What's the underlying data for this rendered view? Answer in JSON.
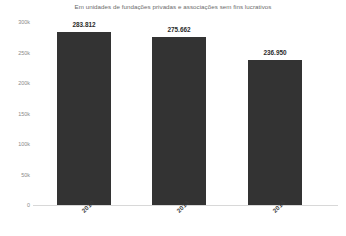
{
  "chart_data": {
    "type": "bar",
    "title": "Em unidades de fundações privadas e associações sem fins lucrativos",
    "xlabel": "",
    "ylabel": "",
    "categories": [
      "2010",
      "2013",
      "2016"
    ],
    "values": [
      283812,
      275662,
      236950
    ],
    "value_labels": [
      "283.812",
      "275.662",
      "236.950"
    ],
    "ylim": [
      0,
      300000
    ],
    "ytick_values": [
      300000,
      250000,
      200000,
      150000,
      100000,
      50000,
      0
    ],
    "ytick_labels": [
      "300k",
      "250k",
      "200k",
      "150k",
      "100k",
      "50k",
      "0"
    ],
    "grid": false,
    "legend": false,
    "legend_position": "none",
    "bar_color": "#333333",
    "axis_color": "#d8d8d8",
    "title_color": "#6b6b6b",
    "tick_label_color": "#8a8a8a",
    "value_label_color": "#2b2b2b",
    "background_color": "#ffffff",
    "category_label_rotation": -45
  }
}
